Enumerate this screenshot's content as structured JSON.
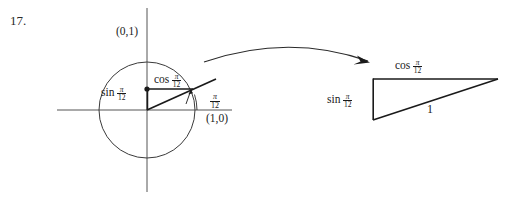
{
  "figure": {
    "problem_number": "17.",
    "background_color": "#ffffff",
    "stroke_color": "#1a1a1a",
    "thin_stroke_color": "#555555"
  },
  "unit_circle": {
    "name": "unit-circle-diagram",
    "center": {
      "x": 147,
      "y": 110
    },
    "radius": 48,
    "axis_x": {
      "from": {
        "x": 57,
        "y": 110
      },
      "to": {
        "x": 232,
        "y": 110
      }
    },
    "axis_y": {
      "from": {
        "x": 147,
        "y": 8
      },
      "to": {
        "x": 147,
        "y": 192
      }
    },
    "terminal_ray": {
      "from": {
        "x": 147,
        "y": 110
      },
      "to": {
        "x": 216,
        "y": 79
      }
    },
    "point_on_circle": {
      "x": 193,
      "y": 89
    },
    "cos_segment": {
      "from": {
        "x": 147,
        "y": 89
      },
      "to": {
        "x": 193,
        "y": 89
      }
    },
    "sin_segment": {
      "from": {
        "x": 147,
        "y": 89
      },
      "to": {
        "x": 147,
        "y": 110
      }
    },
    "labels": {
      "top_point": "(0,1)",
      "right_point": "(1,0)",
      "cos_name": "cos",
      "sin_name": "sin",
      "angle_numerator": "π",
      "angle_denominator": "12"
    }
  },
  "arrow": {
    "name": "transition-arrow",
    "start": {
      "x": 204,
      "y": 62
    },
    "control": {
      "x": 288,
      "y": 33
    },
    "end": {
      "x": 370,
      "y": 62
    }
  },
  "right_triangle": {
    "name": "right-triangle-diagram",
    "top_left": {
      "x": 373,
      "y": 79
    },
    "top_right": {
      "x": 498,
      "y": 79
    },
    "bottom_left": {
      "x": 373,
      "y": 120
    },
    "labels": {
      "top_side_name": "cos",
      "left_side_name": "sin",
      "hypotenuse": "1",
      "angle_numerator": "π",
      "angle_denominator": "12"
    }
  }
}
